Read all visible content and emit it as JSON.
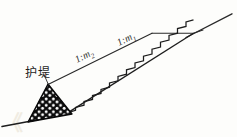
{
  "figure": {
    "kind": "engineering-cross-section",
    "background_color": "#fdfdfb",
    "ink_color": "#1d1d1d"
  },
  "labels": {
    "levee": "护堤",
    "slope_upper_prefix": "1:m",
    "slope_upper_sub": "1",
    "slope_lower_prefix": "1:m",
    "slope_lower_sub": "2"
  },
  "ghost_text": {
    "left": "《",
    "middle": ""
  },
  "geometry": {
    "ground_line": {
      "x1": 2,
      "y1": 126,
      "x2": 66,
      "y2": 113
    },
    "upper_slope": {
      "x1": 48,
      "y1": 84,
      "x2": 152,
      "y2": 33
    },
    "berm": {
      "x1": 152,
      "y1": 33,
      "x2": 193,
      "y2": 33
    },
    "crest_slope": {
      "x1": 186,
      "y1": 37,
      "x2": 232,
      "y2": 14
    },
    "bench_slope": {
      "x1": 68,
      "y1": 112,
      "x2": 193,
      "y2": 33
    },
    "levee_triangle": [
      {
        "x": 28,
        "y": 122
      },
      {
        "x": 48,
        "y": 84
      },
      {
        "x": 72,
        "y": 114
      }
    ],
    "leader_line": {
      "x1": 44,
      "y1": 74,
      "x2": 49,
      "y2": 85
    },
    "step_count": 14
  }
}
